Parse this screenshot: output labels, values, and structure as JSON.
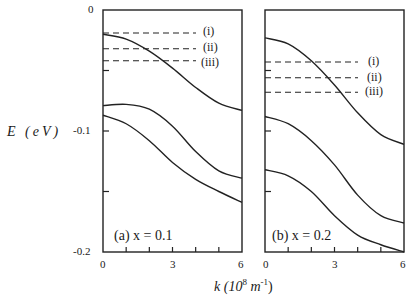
{
  "chart_data": {
    "type": "line",
    "ylabel": "E (eV)",
    "xlabel": "k (10^8 m^-1)",
    "xlabel_parts": {
      "base": "k (10",
      "exp1": "8",
      "unit": " m",
      "exp2": "-1",
      "close": ")"
    },
    "ylim": [
      -0.2,
      0
    ],
    "xlim": [
      0,
      6
    ],
    "ytick_labels": [
      "0",
      "-0.1",
      "-0.2"
    ],
    "xtick_labels": [
      "0",
      "3",
      "6"
    ],
    "panels": [
      {
        "label": "(a) x = 0.1",
        "label_parts": {
          "letter": "a",
          "eq": "x = 0.1"
        },
        "series": [
          {
            "name": "band 1",
            "x": [
              0,
              1,
              2,
              3,
              4,
              5,
              6
            ],
            "y": [
              -0.02,
              -0.024,
              -0.034,
              -0.048,
              -0.064,
              -0.077,
              -0.083
            ]
          },
          {
            "name": "band 2",
            "x": [
              0,
              1,
              2,
              3,
              4,
              5,
              6
            ],
            "y": [
              -0.079,
              -0.078,
              -0.082,
              -0.096,
              -0.117,
              -0.133,
              -0.139
            ]
          },
          {
            "name": "band 3",
            "x": [
              0,
              1,
              2,
              3,
              4,
              5,
              6
            ],
            "y": [
              -0.087,
              -0.094,
              -0.108,
              -0.126,
              -0.14,
              -0.15,
              -0.159
            ]
          }
        ],
        "dashed_levels": [
          {
            "label": "(i)",
            "y": -0.019
          },
          {
            "label": "(ii)",
            "y": -0.032
          },
          {
            "label": "(iii)",
            "y": -0.042
          }
        ]
      },
      {
        "label": "(b) x = 0.2",
        "label_parts": {
          "letter": "b",
          "eq": "x = 0.2"
        },
        "series": [
          {
            "name": "band 1",
            "x": [
              0,
              1,
              2,
              3,
              4,
              5,
              6
            ],
            "y": [
              -0.023,
              -0.028,
              -0.042,
              -0.062,
              -0.085,
              -0.103,
              -0.111
            ]
          },
          {
            "name": "band 2",
            "x": [
              0,
              1,
              2,
              3,
              4,
              5,
              6
            ],
            "y": [
              -0.088,
              -0.094,
              -0.108,
              -0.128,
              -0.153,
              -0.17,
              -0.176
            ]
          },
          {
            "name": "band 3",
            "x": [
              0,
              1,
              2,
              3,
              4,
              5,
              6
            ],
            "y": [
              -0.132,
              -0.137,
              -0.15,
              -0.17,
              -0.186,
              -0.194,
              -0.2
            ]
          }
        ],
        "dashed_levels": [
          {
            "label": "(i)",
            "y": -0.043
          },
          {
            "label": "(ii)",
            "y": -0.056
          },
          {
            "label": "(iii)",
            "y": -0.068
          }
        ]
      }
    ],
    "grid": false,
    "legend": "none"
  }
}
